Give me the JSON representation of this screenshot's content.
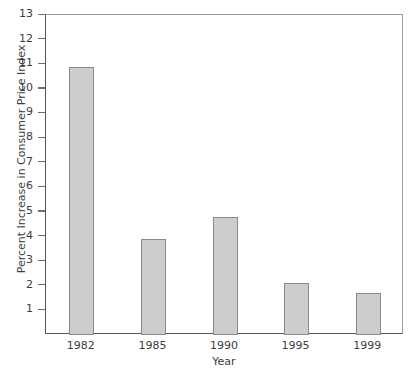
{
  "chart_data": {
    "type": "bar",
    "title": "",
    "categories": [
      "1982",
      "1985",
      "1990",
      "1995",
      "1999"
    ],
    "values": [
      10.9,
      3.9,
      4.8,
      2.1,
      1.7
    ],
    "xlabel": "Year",
    "ylabel": "Percent Increase in Consumer Price Index",
    "ylim": [
      0,
      13
    ],
    "xlim": [
      0,
      5
    ],
    "y_tick_labels": [
      "13",
      "12",
      "11",
      "10",
      "9",
      "8",
      "7",
      "6",
      "5",
      "4",
      "3",
      "2",
      "1"
    ],
    "y_tick_values": [
      13,
      12,
      11,
      10,
      9,
      8,
      7,
      6,
      5,
      4,
      3,
      2,
      1
    ],
    "x_tick_labels": [
      "1982",
      "1985",
      "1990",
      "1995",
      "1999"
    ],
    "grid": false,
    "legend": null,
    "legend_position": "none",
    "bar_fill_color": "#cdcdcd",
    "bar_edge_color": "#8a8a8a",
    "axis_color": "#555555",
    "frame_color": "#9a9a9a",
    "background_color": "#ffffff",
    "series": [
      {
        "name": "Percent Increase in Consumer Price Index",
        "values": [
          10.9,
          3.9,
          4.8,
          2.1,
          1.7
        ]
      }
    ],
    "annotations": []
  },
  "caption": {
    "fragment": ""
  }
}
